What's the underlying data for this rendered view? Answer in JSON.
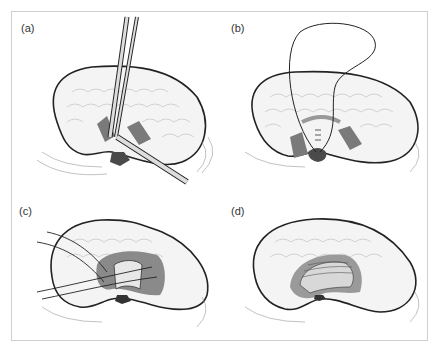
{
  "figure": {
    "panels": [
      {
        "label": "(a)",
        "description": "Incision with scissors and forceps"
      },
      {
        "label": "(b)",
        "description": "Suture placement"
      },
      {
        "label": "(c)",
        "description": "Multiple sutures placed"
      },
      {
        "label": "(d)",
        "description": "Completed closure"
      }
    ],
    "colors": {
      "line": "#222222",
      "shade": "#7a7a7a",
      "dark": "#4a4a4a",
      "frame": "#cfcfcf"
    }
  }
}
